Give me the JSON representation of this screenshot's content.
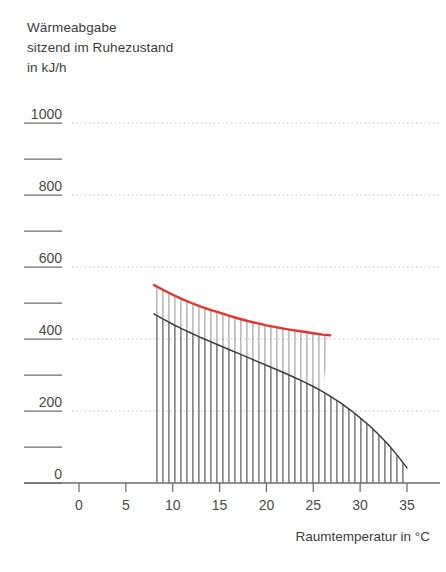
{
  "title": {
    "line1": "Wärmeabgabe",
    "line2": "sitzend im Ruhezustand",
    "line3": "in kJ/h"
  },
  "chart_data": {
    "type": "line",
    "title": "Wärmeabgabe sitzend im Ruhezustand in kJ/h",
    "xlabel": "Raumtemperatur in  °C",
    "ylabel": "in kJ/h",
    "xlim": [
      -2,
      36.5
    ],
    "ylim": [
      0,
      1050
    ],
    "grid": true,
    "legend": "none",
    "x_ticks": [
      "0",
      "5",
      "10",
      "15",
      "20",
      "25",
      "30",
      "35"
    ],
    "x_tick_values": [
      0,
      5,
      10,
      15,
      20,
      25,
      30,
      35
    ],
    "y_ticks": [
      "0",
      "200",
      "400",
      "600",
      "800",
      "1000"
    ],
    "y_tick_values": [
      0,
      200,
      400,
      600,
      800,
      1000
    ],
    "y_minor_tick_values": [
      100,
      300,
      500,
      700,
      900
    ],
    "gridline_values": [
      200,
      400,
      600,
      800,
      1000
    ],
    "series": [
      {
        "name": "Gesamtwaermeabgabe",
        "color": "#e8322a",
        "style": "solid-line",
        "x": [
          8,
          9,
          10,
          11,
          12,
          13,
          14,
          15,
          16,
          17,
          18,
          19,
          20,
          21,
          22,
          23,
          24,
          25,
          26,
          26.8
        ],
        "y": [
          550,
          536,
          523,
          511,
          500,
          490,
          481,
          473,
          465,
          457,
          450,
          444,
          438,
          433,
          428,
          424,
          420,
          416,
          412,
          410
        ]
      },
      {
        "name": "Trockene Waermeabgabe",
        "color": "#3d3d3d",
        "style": "solid-line-hatched-area",
        "x": [
          8,
          9,
          10,
          11,
          12,
          13,
          14,
          15,
          16,
          17,
          18,
          19,
          20,
          21,
          22,
          23,
          24,
          25,
          26,
          27,
          28,
          29,
          30,
          31,
          32,
          33,
          34,
          35
        ],
        "y": [
          470,
          455,
          441,
          428,
          416,
          404,
          393,
          382,
          371,
          360,
          349,
          338,
          327,
          316,
          305,
          293,
          281,
          268,
          254,
          238,
          221,
          202,
          181,
          159,
          134,
          107,
          76,
          42
        ]
      }
    ],
    "hatch": {
      "orientation": "vertical",
      "spacing_px": 6,
      "color": "#6b6b6b",
      "x_from": 8,
      "x_to": 35
    }
  }
}
